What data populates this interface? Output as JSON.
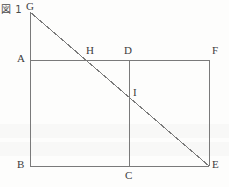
{
  "figure": {
    "caption": "図 1",
    "type": "geometry-diagram",
    "canvas": {
      "width": 229,
      "height": 187
    },
    "stroke_color": "#7a7a7a",
    "label_color": "#3c3c3c",
    "background_color": "#fdfdfc",
    "stroke_width": 1
  },
  "points": [
    {
      "id": "G",
      "label": "G",
      "x": 30,
      "y": 12,
      "label_x": 26,
      "label_y": 1
    },
    {
      "id": "A",
      "label": "A",
      "x": 30,
      "y": 60,
      "label_x": 17,
      "label_y": 53
    },
    {
      "id": "B",
      "label": "B",
      "x": 30,
      "y": 166,
      "label_x": 17,
      "label_y": 159
    },
    {
      "id": "C",
      "label": "C",
      "x": 129,
      "y": 166,
      "label_x": 125,
      "label_y": 170
    },
    {
      "id": "D",
      "label": "D",
      "x": 129,
      "y": 60,
      "label_x": 124,
      "label_y": 45
    },
    {
      "id": "E",
      "label": "E",
      "x": 209,
      "y": 166,
      "label_x": 212,
      "label_y": 159
    },
    {
      "id": "F",
      "label": "F",
      "x": 209,
      "y": 60,
      "label_x": 212,
      "label_y": 45
    },
    {
      "id": "H",
      "label": "H",
      "x": 90,
      "y": 60,
      "label_x": 86,
      "label_y": 45
    },
    {
      "id": "I",
      "label": "I",
      "x": 129,
      "y": 95,
      "label_x": 133,
      "label_y": 87
    }
  ],
  "segments": [
    {
      "id": "GB",
      "name": "segment-g-b",
      "from": "G",
      "to": "B"
    },
    {
      "id": "AF",
      "name": "segment-a-f",
      "from": "A",
      "to": "F"
    },
    {
      "id": "BE",
      "name": "segment-b-e",
      "from": "B",
      "to": "E"
    },
    {
      "id": "FE",
      "name": "segment-f-e",
      "from": "F",
      "to": "E"
    },
    {
      "id": "DC",
      "name": "segment-d-c",
      "from": "D",
      "to": "C"
    },
    {
      "id": "GE",
      "name": "diagonal-segment-g-e",
      "from": "G",
      "to": "E"
    }
  ]
}
